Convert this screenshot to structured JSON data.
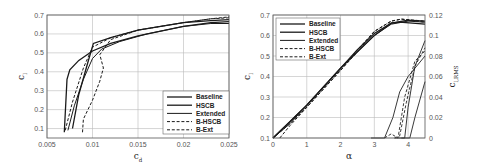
{
  "chart_data": [
    {
      "type": "line",
      "title": "",
      "xlabel": "c_d",
      "ylabel": "c_l",
      "xlim": [
        0.005,
        0.025
      ],
      "ylim": [
        0.05,
        0.7
      ],
      "xticks": [
        "0.005",
        "0.01",
        "0.015",
        "0.02",
        "0.025"
      ],
      "yticks": [
        "0.1",
        "0.2",
        "0.3",
        "0.4",
        "0.5",
        "0.6",
        "0.7"
      ],
      "grid": true,
      "legend_position": "lower right",
      "series": [
        {
          "name": "Baseline",
          "style": "solid",
          "x": [
            0.0069,
            0.0072,
            0.0075,
            0.0085,
            0.01,
            0.012,
            0.015,
            0.02,
            0.023,
            0.025
          ],
          "y": [
            0.08,
            0.36,
            0.41,
            0.46,
            0.51,
            0.55,
            0.59,
            0.64,
            0.66,
            0.665
          ]
        },
        {
          "name": "HSCB",
          "style": "solid",
          "x": [
            0.0078,
            0.0085,
            0.0095,
            0.0101,
            0.012,
            0.015,
            0.02,
            0.023,
            0.025
          ],
          "y": [
            0.1,
            0.28,
            0.45,
            0.55,
            0.58,
            0.62,
            0.66,
            0.67,
            0.675
          ]
        },
        {
          "name": "Extended",
          "style": "solid",
          "x": [
            0.0073,
            0.008,
            0.009,
            0.01,
            0.011,
            0.013,
            0.016,
            0.02,
            0.023,
            0.025
          ],
          "y": [
            0.09,
            0.22,
            0.36,
            0.47,
            0.52,
            0.56,
            0.6,
            0.64,
            0.655,
            0.655
          ]
        },
        {
          "name": "B-HSCB",
          "style": "dashed",
          "x": [
            0.007,
            0.0078,
            0.009,
            0.01,
            0.012,
            0.015,
            0.02,
            0.023,
            0.025
          ],
          "y": [
            0.09,
            0.24,
            0.42,
            0.53,
            0.58,
            0.62,
            0.66,
            0.68,
            0.685
          ]
        },
        {
          "name": "B-Ext",
          "style": "dashed",
          "x": [
            0.0089,
            0.009,
            0.01,
            0.0108,
            0.0112,
            0.0108,
            0.012,
            0.015,
            0.02,
            0.023,
            0.025
          ],
          "y": [
            0.08,
            0.15,
            0.25,
            0.35,
            0.42,
            0.49,
            0.57,
            0.62,
            0.66,
            0.68,
            0.69
          ]
        }
      ]
    },
    {
      "type": "line",
      "title": "",
      "xlabel": "α",
      "ylabel": "c_l",
      "ylabel_right": "c_l,RMS",
      "xlim": [
        0,
        4.5
      ],
      "ylim": [
        0.1,
        0.7
      ],
      "ylim_right": [
        0,
        0.12
      ],
      "xticks": [
        "0",
        "1",
        "2",
        "3",
        "4"
      ],
      "yticks": [
        "0.1",
        "0.2",
        "0.3",
        "0.4",
        "0.5",
        "0.6",
        "0.7"
      ],
      "yticks_right": [
        "0",
        "0.02",
        "0.04",
        "0.06",
        "0.08",
        "0.1",
        "0.12"
      ],
      "grid": true,
      "legend_position": "upper left",
      "series": [
        {
          "name": "Baseline",
          "style": "solid",
          "x": [
            0,
            0.5,
            1,
            1.5,
            2,
            2.5,
            3,
            3.5,
            4,
            4.5
          ],
          "y": [
            0.1,
            0.18,
            0.26,
            0.35,
            0.44,
            0.53,
            0.61,
            0.66,
            0.675,
            0.67
          ]
        },
        {
          "name": "HSCB",
          "style": "solid",
          "x": [
            0,
            0.5,
            1,
            1.5,
            2,
            2.5,
            3,
            3.5,
            3.75,
            4.5
          ],
          "y": [
            0.1,
            0.18,
            0.26,
            0.35,
            0.44,
            0.52,
            0.6,
            0.66,
            0.665,
            0.655
          ]
        },
        {
          "name": "Extended",
          "style": "solid",
          "x": [
            0,
            0.5,
            1,
            1.5,
            2,
            2.5,
            3,
            3.5,
            4,
            4.5
          ],
          "y": [
            0.1,
            0.17,
            0.26,
            0.35,
            0.44,
            0.52,
            0.6,
            0.655,
            0.67,
            0.665
          ]
        },
        {
          "name": "B-HSCB",
          "style": "dashed",
          "x": [
            0,
            0.5,
            1,
            1.5,
            2,
            2.5,
            3,
            3.5,
            3.8,
            4.5
          ],
          "y": [
            0.1,
            0.17,
            0.25,
            0.34,
            0.43,
            0.53,
            0.62,
            0.67,
            0.68,
            0.67
          ]
        },
        {
          "name": "B-Ext",
          "style": "dashed",
          "x": [
            0.2,
            0.5,
            1,
            1.5,
            2,
            2.5,
            3,
            3.5,
            3.8,
            4.5
          ],
          "y": [
            0.1,
            0.16,
            0.25,
            0.34,
            0.43,
            0.52,
            0.62,
            0.67,
            0.68,
            0.665
          ]
        }
      ],
      "rms_series": [
        {
          "name": "Baseline RMS",
          "style": "solid",
          "x": [
            2.9,
            3.3,
            3.55,
            3.75,
            4.0,
            4.5
          ],
          "y": [
            0,
            0,
            0.02,
            0.045,
            0.06,
            0.08
          ]
        },
        {
          "name": "HSCB RMS",
          "style": "solid",
          "x": [
            3.6,
            3.9,
            4.0,
            4.2,
            4.5
          ],
          "y": [
            0,
            0,
            0.03,
            0.07,
            0.095
          ]
        },
        {
          "name": "Extended RMS",
          "style": "solid",
          "x": [
            3.8,
            4.05,
            4.2,
            4.5
          ],
          "y": [
            0,
            0,
            0.02,
            0.055
          ]
        },
        {
          "name": "B-HSCB RMS",
          "style": "dashed",
          "x": [
            3.3,
            3.5,
            3.7,
            3.9,
            4.2,
            4.5
          ],
          "y": [
            0,
            0.004,
            0,
            0.04,
            0.075,
            0.085
          ]
        },
        {
          "name": "B-Ext RMS",
          "style": "dashed",
          "x": [
            3.6,
            3.75,
            3.95,
            4.2,
            4.5
          ],
          "y": [
            0,
            0.002,
            0.035,
            0.07,
            0.088
          ]
        }
      ]
    }
  ]
}
